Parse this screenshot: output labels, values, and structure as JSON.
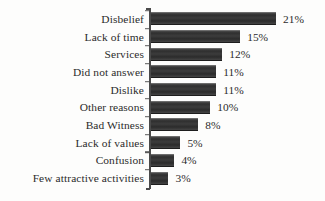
{
  "chart_data": {
    "type": "bar",
    "orientation": "horizontal",
    "title": "",
    "subtitle": "",
    "xlabel": "",
    "ylabel": "",
    "xlim": [
      0,
      21
    ],
    "grid": false,
    "legend": null,
    "value_suffix": "%",
    "categories": [
      "Disbelief",
      "Lack of time",
      "Services",
      "Did not answer",
      "Dislike",
      "Other reasons",
      "Bad Witness",
      "Lack of values",
      "Confusion",
      "Few attractive activities"
    ],
    "values": [
      21,
      15,
      12,
      11,
      11,
      10,
      8,
      5,
      4,
      3
    ],
    "value_labels": [
      "21%",
      "15%",
      "12%",
      "11%",
      "11%",
      "10%",
      "8%",
      "5%",
      "4%",
      "3%"
    ],
    "bars": [
      {
        "category": "Disbelief",
        "value": 21,
        "label": "21%"
      },
      {
        "category": "Lack of time",
        "value": 15,
        "label": "15%"
      },
      {
        "category": "Services",
        "value": 12,
        "label": "12%"
      },
      {
        "category": "Did not answer",
        "value": 11,
        "label": "11%"
      },
      {
        "category": "Dislike",
        "value": 11,
        "label": "11%"
      },
      {
        "category": "Other reasons",
        "value": 10,
        "label": "10%"
      },
      {
        "category": "Bad Witness",
        "value": 8,
        "label": "8%"
      },
      {
        "category": "Lack of values",
        "value": 5,
        "label": "5%"
      },
      {
        "category": "Confusion",
        "value": 4,
        "label": "4%"
      },
      {
        "category": "Few attractive activities",
        "value": 3,
        "label": "3%"
      }
    ],
    "colors": {
      "bar": "#373737",
      "background": "#fdfdfc",
      "axis": "#4a4a4a",
      "text": "#2b2b2b"
    }
  }
}
